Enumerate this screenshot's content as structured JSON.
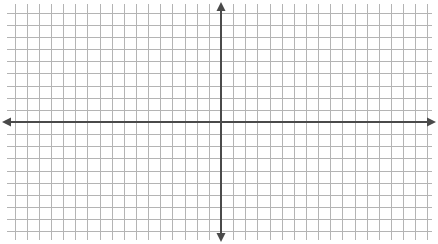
{
  "figure": {
    "title": "",
    "background_color": "#ffffff",
    "width": 438,
    "height": 244
  },
  "chart_data": {
    "type": "line",
    "title": "",
    "subtitle": "",
    "xlabel": "",
    "ylabel": "",
    "series": [],
    "categories": [],
    "annotations": [],
    "legend": {
      "entries": [],
      "position": "none"
    },
    "grid": {
      "visible": true,
      "color": "#b4b4b4",
      "minor_color": "#c8c8c8",
      "border_color": "#9a9a9a",
      "cell_size_px": 12.14,
      "columns": 35,
      "rows": 19,
      "left_px": 7,
      "top_px": 4,
      "right_px": 432,
      "bottom_px": 240,
      "x_gridlines_count": 36,
      "y_gridlines_count": 20
    },
    "axes": {
      "color": "#4a4a4a",
      "line_width_px": 2,
      "origin_px": {
        "x": 221,
        "y": 122
      },
      "x_axis": {
        "label": "",
        "visible": true,
        "y_px": 122,
        "start_px": 2,
        "end_px": 436,
        "arrow_start": true,
        "arrow_end": true,
        "tick_labels": [],
        "xlim_cells": [
          -17.6,
          17.4
        ],
        "units_per_cell": 1
      },
      "y_axis": {
        "label": "",
        "visible": true,
        "x_px": 221,
        "start_px": 2,
        "end_px": 242,
        "arrow_start": true,
        "arrow_end": true,
        "tick_labels": [],
        "ylim_cells": [
          -9.9,
          9.8
        ],
        "units_per_cell": 1
      }
    }
  }
}
